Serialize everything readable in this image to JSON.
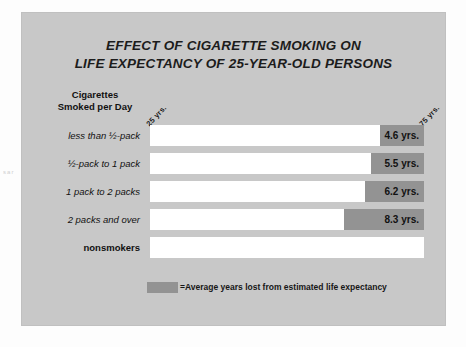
{
  "chart_data": {
    "type": "bar",
    "title": "EFFECT OF CIGARETTE SMOKING ON LIFE EXPECTANCY OF 25-YEAR-OLD PERSONS",
    "title_line1": "EFFECT OF CIGARETTE SMOKING ON",
    "title_line2": "LIFE EXPECTANCY OF 25-YEAR-OLD PERSONS",
    "xlabel": "",
    "ylabel": "Cigarettes Smoked per Day",
    "category_header_line1": "Cigarettes",
    "category_header_line2": "Smoked per Day",
    "axis_start_label": "25 yrs.",
    "axis_end_label": "75 yrs.",
    "xlim": [
      25,
      75
    ],
    "grid": false,
    "orientation": "horizontal",
    "units": "yrs.",
    "legend_position": "bottom",
    "legend_label": "=Average years lost from estimated life expectancy",
    "categories": [
      "less than ½-pack",
      "½-pack to 1 pack",
      "1 pack to 2 packs",
      "2 packs and over",
      "nonsmokers"
    ],
    "series": [
      {
        "name": "Average years lost from estimated life expectancy",
        "values": [
          4.6,
          5.5,
          6.2,
          8.3,
          0
        ]
      }
    ],
    "value_labels": [
      "4.6 yrs.",
      "5.5 yrs.",
      "6.2 yrs.",
      "8.3 yrs.",
      ""
    ],
    "colors": {
      "panel_background": "#c8c8c8",
      "bar_full": "#ffffff",
      "bar_lost_segment": "#939393",
      "text": "#111111"
    },
    "rows": [
      {
        "label": "less than ½-pack",
        "value": 4.6,
        "value_label": "4.6 yrs.",
        "bold": false,
        "lost_pct": 9.2
      },
      {
        "label": "½-pack to 1 pack",
        "value": 5.5,
        "value_label": "5.5 yrs.",
        "bold": false,
        "lost_pct": 11.0
      },
      {
        "label": "1 pack to 2 packs",
        "value": 6.2,
        "value_label": "6.2 yrs.",
        "bold": false,
        "lost_pct": 12.4
      },
      {
        "label": "2 packs and over",
        "value": 8.3,
        "value_label": "8.3 yrs.",
        "bold": false,
        "lost_pct": 16.6
      },
      {
        "label": "nonsmokers",
        "value": 0,
        "value_label": "",
        "bold": true,
        "lost_pct": 0
      }
    ]
  },
  "page": {
    "bleed_text": "s\na\nr"
  }
}
